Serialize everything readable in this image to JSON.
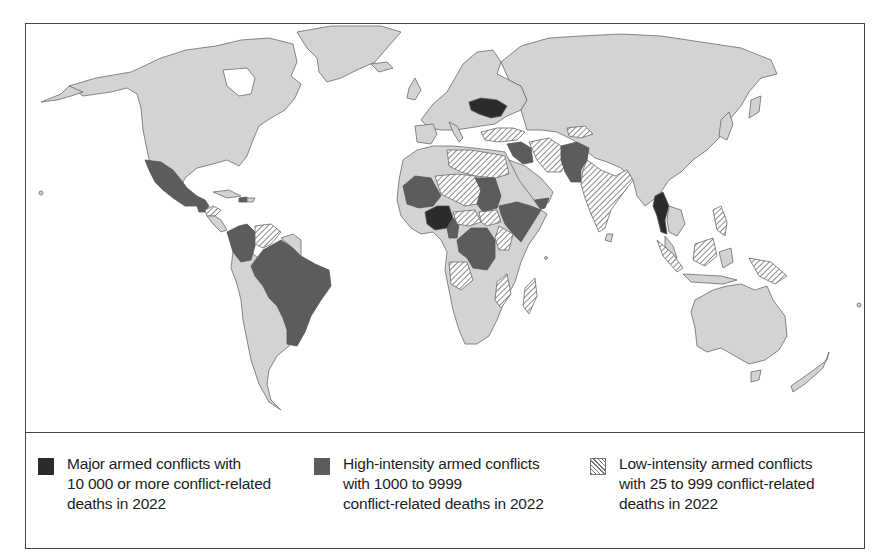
{
  "map": {
    "title": "World map of armed conflicts in 2022",
    "colors": {
      "land": "#d3d3d3",
      "major": "#2b2b2b",
      "high": "#5c5c5c",
      "low_hatch": "#777777",
      "border": "#444444"
    },
    "categories": {
      "major": [
        "Ukraine",
        "Nigeria",
        "Myanmar"
      ],
      "high": [
        "Mexico",
        "Guatemala",
        "Haiti",
        "Colombia",
        "Brazil",
        "Mali",
        "Burkina Faso",
        "Cameroon",
        "Sudan",
        "Ethiopia",
        "Somalia",
        "DR Congo",
        "Syria",
        "Iraq",
        "Yemen",
        "Afghanistan",
        "Pakistan"
      ],
      "low": [
        "Honduras",
        "Venezuela",
        "Libya",
        "Egypt",
        "Niger",
        "Chad",
        "Central African Republic",
        "South Sudan",
        "Kenya",
        "Angola",
        "Mozambique",
        "Madagascar",
        "Turkey",
        "Iran",
        "India",
        "Tajikistan",
        "Kyrgyzstan",
        "Philippines",
        "Indonesia",
        "Papua New Guinea"
      ]
    }
  },
  "legend": {
    "items": [
      {
        "key": "major",
        "label": "Major armed conflicts with\n10 000 or more conflict-related\ndeaths in 2022"
      },
      {
        "key": "high",
        "label": "High-intensity armed conflicts\nwith 1000 to 9999\nconflict-related deaths in 2022"
      },
      {
        "key": "low",
        "label": "Low-intensity armed conflicts\nwith 25 to 999 conflict-related\ndeaths in 2022"
      }
    ]
  }
}
